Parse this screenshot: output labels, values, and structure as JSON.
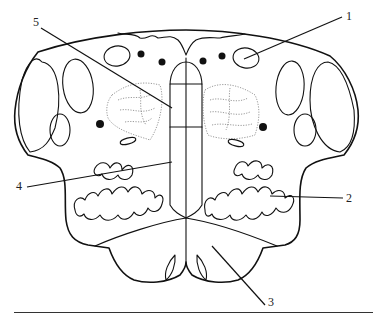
{
  "figure": {
    "type": "anatomical cross-section line drawing",
    "labels": [
      {
        "id": "1",
        "text": "1",
        "x": 346,
        "y": 12
      },
      {
        "id": "2",
        "text": "2",
        "x": 347,
        "y": 192
      },
      {
        "id": "3",
        "text": "3",
        "x": 268,
        "y": 294
      },
      {
        "id": "4",
        "text": "4",
        "x": 16,
        "y": 180
      },
      {
        "id": "5",
        "text": "5",
        "x": 33,
        "y": 17
      }
    ],
    "colors": {
      "line": "#111111",
      "background": "#ffffff"
    }
  }
}
